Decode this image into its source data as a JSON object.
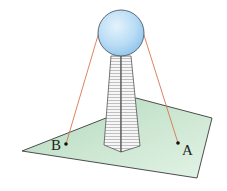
{
  "diagram": {
    "labels": {
      "point_a": "A",
      "point_b": "B"
    },
    "colors": {
      "sphere_fill": "#bfe0f6",
      "sphere_stroke": "#4a5a6a",
      "plane_fill": "#c9e6cf",
      "plane_stroke": "#3a3a3a",
      "cable": "#d8764e",
      "tower_fill": "#f4f4f4",
      "tower_stroke": "#555555",
      "tower_hatch": "#9a9a9a"
    }
  }
}
